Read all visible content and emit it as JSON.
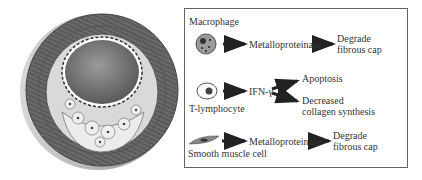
{
  "figure": {
    "left_panel": {
      "label": "artery-cross-section-with-plaque"
    },
    "legend_box": {
      "rows": [
        {
          "cell": "Macrophage",
          "icon": "macrophage-icon",
          "steps": [
            "Metalloproteinase",
            "Degrade",
            "fibrous cap"
          ]
        },
        {
          "cell": "T-lymphocyte",
          "icon": "t-lymphocyte-icon",
          "mediator": "IFN-γ",
          "outcomes": [
            "Apoptosis",
            "Decreased",
            "collagen synthesis"
          ]
        },
        {
          "cell": "Smooth muscle cell",
          "icon": "smooth-muscle-cell-icon",
          "steps": [
            "Metalloproteinase",
            "Degrade",
            "fibrous cap"
          ]
        }
      ]
    },
    "colors": {
      "vessel_wall": "#6e6e6e",
      "lumen": "#7a7a7a",
      "plaque": "#e2e2e2",
      "box_border": "#666666"
    }
  }
}
